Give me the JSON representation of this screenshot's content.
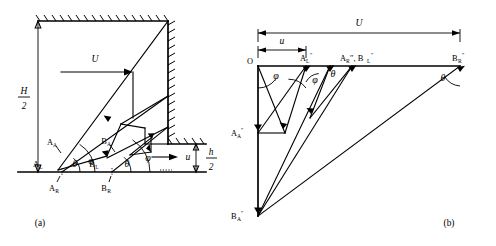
{
  "figure": {
    "panels": [
      {
        "id": "a",
        "caption": "(a)",
        "labels": {
          "H_over_2_num": "H",
          "H_over_2_den": "2",
          "h_over_2_num": "h",
          "h_over_2_den": "2",
          "U": "U",
          "u": "u",
          "A_A_base": "A",
          "A_A_sub": "A",
          "A_L_base": "A",
          "A_L_sub": "L",
          "A_R_base": "A",
          "A_R_sub": "R",
          "B_A_base": "B",
          "B_A_sub": "A",
          "B_L_base": "B",
          "B_L_sub": "L",
          "B_R_base": "B",
          "B_R_sub": "R",
          "theta_1": "θ",
          "phi_1": "φ",
          "theta_2": "θ",
          "phi_2": "φ"
        }
      },
      {
        "id": "b",
        "caption": "(b)",
        "labels": {
          "U": "U",
          "u": "u",
          "O": "O",
          "AL_base": "A",
          "AL_sub": "L",
          "AL_prime": "″",
          "ARBL_text": "A",
          "ARBL_sub1": "R",
          "ARBL_mid": "″, B",
          "ARBL_sub2": "L",
          "ARBL_prime": "″",
          "BR_base": "B",
          "BR_sub": "R",
          "BR_prime": "″",
          "AA_base": "A",
          "AA_sub": "A",
          "AA_prime": "″",
          "BA_base": "B",
          "BA_sub": "A",
          "BA_prime": "″",
          "phi_1": "φ",
          "phi_2": "φ",
          "theta_1": "θ",
          "theta_2": "θ"
        }
      }
    ],
    "colors": {
      "ink": "#000000",
      "paper": "#ffffff"
    }
  }
}
